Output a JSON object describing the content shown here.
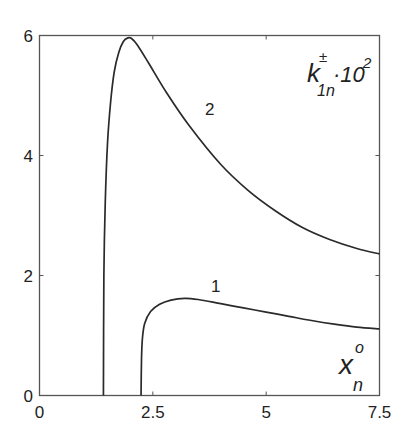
{
  "chart_data": {
    "type": "line",
    "title": "",
    "xlabel": "x_n^o",
    "ylabel": "k_1n^± · 10^2",
    "xlim": [
      0,
      7.5
    ],
    "ylim": [
      0,
      6
    ],
    "grid": false,
    "legend": "none (curves labeled inline '1' and '2')",
    "x_ticks": [
      "0",
      "2.5",
      "5",
      "7.5"
    ],
    "y_ticks": [
      "0",
      "2",
      "4",
      "6"
    ],
    "annotations": [
      {
        "text": "k",
        "sup": "±",
        "sub": "1n",
        "suffix": "·10",
        "suffix_sup": "2",
        "position": "top-right"
      },
      {
        "text": "x",
        "sup": "o",
        "sub": "n",
        "position": "bottom-right"
      },
      {
        "text": "1",
        "target": "curve 1"
      },
      {
        "text": "2",
        "target": "curve 2"
      }
    ],
    "series": [
      {
        "name": "1",
        "x": [
          2.24,
          2.25,
          2.27,
          2.32,
          2.45,
          2.65,
          2.9,
          3.2,
          3.5,
          4.0,
          4.5,
          5.0,
          5.5,
          6.0,
          6.5,
          7.0,
          7.5
        ],
        "y": [
          0.0,
          0.6,
          0.95,
          1.2,
          1.4,
          1.52,
          1.59,
          1.62,
          1.6,
          1.53,
          1.46,
          1.39,
          1.32,
          1.25,
          1.19,
          1.14,
          1.11
        ]
      },
      {
        "name": "2",
        "x": [
          1.41,
          1.42,
          1.45,
          1.5,
          1.57,
          1.65,
          1.75,
          1.85,
          1.95,
          2.03,
          2.15,
          2.4,
          2.8,
          3.3,
          4.0,
          4.6,
          5.2,
          5.8,
          6.4,
          7.0,
          7.5
        ],
        "y": [
          0.0,
          2.0,
          3.2,
          4.2,
          4.9,
          5.4,
          5.72,
          5.9,
          5.96,
          5.95,
          5.85,
          5.55,
          5.05,
          4.5,
          3.85,
          3.42,
          3.08,
          2.8,
          2.6,
          2.45,
          2.36
        ]
      }
    ]
  },
  "labels": {
    "x_ticks": [
      "0",
      "2.5",
      "5",
      "7.5"
    ],
    "y_ticks": [
      "0",
      "2",
      "4",
      "6"
    ],
    "curve1": "1",
    "curve2": "2",
    "ylabel_base": "k",
    "ylabel_sup": "±",
    "ylabel_sub": "1n",
    "ylabel_suffix": "·10",
    "ylabel_suffix_sup": "2",
    "xlabel_base": "x",
    "xlabel_sup": "o",
    "xlabel_sub": "n"
  }
}
